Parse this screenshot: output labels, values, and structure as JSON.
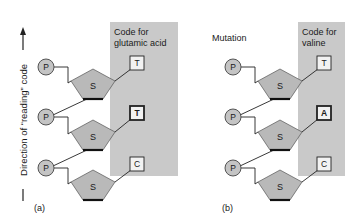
{
  "axis_label": "— Direction of “reading” code —",
  "axis_label_text": "Direction of “reading” code",
  "colors": {
    "shaded_region": "#c9c9c9",
    "sugar_fill": "#b9b9b9",
    "phosphate_fill": "#c4c4c4",
    "base_fill": "#f2f2f2",
    "stroke": "#222222"
  },
  "phosphate_label": "P",
  "sugar_label": "S",
  "panels": [
    {
      "id": "a",
      "caption": "(a)",
      "header": "",
      "code_label_line1": "Code for",
      "code_label_line2": "glutamic acid",
      "bases": [
        {
          "letter": "T",
          "highlighted": false
        },
        {
          "letter": "T",
          "highlighted": true
        },
        {
          "letter": "C",
          "highlighted": false
        }
      ]
    },
    {
      "id": "b",
      "caption": "(b)",
      "header": "Mutation",
      "code_label_line1": "Code for",
      "code_label_line2": "valine",
      "bases": [
        {
          "letter": "T",
          "highlighted": false
        },
        {
          "letter": "A",
          "highlighted": true
        },
        {
          "letter": "C",
          "highlighted": false
        }
      ]
    }
  ]
}
